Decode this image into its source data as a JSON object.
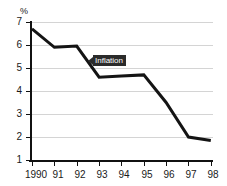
{
  "chart_data": {
    "type": "line",
    "title": "",
    "subtitle": "",
    "xlabel": "",
    "ylabel": "%",
    "x": [
      "1990",
      "91",
      "92",
      "93",
      "94",
      "95",
      "96",
      "97",
      "98"
    ],
    "categories": [
      "1990",
      "91",
      "92",
      "93",
      "94",
      "95",
      "96",
      "97",
      "98"
    ],
    "series": [
      {
        "name": "Inflation",
        "values": [
          6.7,
          5.9,
          5.95,
          4.6,
          4.65,
          4.7,
          3.5,
          2.0,
          1.85
        ]
      }
    ],
    "ylim": [
      1,
      7
    ],
    "yticks": [
      1,
      2,
      3,
      4,
      5,
      6,
      7
    ],
    "ytick_labels": [
      "1",
      "2",
      "3",
      "4",
      "5",
      "6",
      "7"
    ],
    "xtick_labels": [
      "1990",
      "91",
      "92",
      "93",
      "94",
      "95",
      "96",
      "97",
      "98"
    ],
    "grid": true,
    "grid_axis": "y",
    "legend": false,
    "legend_position": "none",
    "annotations": [
      {
        "text": "Inflation",
        "style": "dark-callout-left-arrow",
        "attach_x": "92.5",
        "attach_y": "5.3"
      }
    ],
    "colors": {
      "line": "#141414",
      "grid": "#d4d4d4",
      "axis": "#111111",
      "text": "#1a1a1a",
      "callout_bg": "#2b2b2b",
      "callout_text": "#ffffff",
      "background": "#ffffff"
    }
  }
}
